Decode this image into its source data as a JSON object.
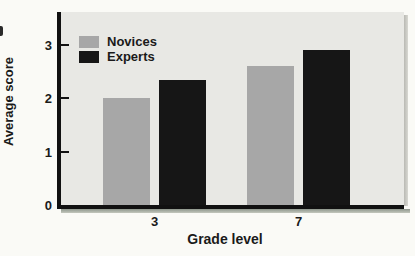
{
  "figure": {
    "page_background": "#fafaf6",
    "plot_background": "#e8e8e4",
    "axis_color": "#111111",
    "text_color": "#1a1a1a"
  },
  "legend": {
    "items": [
      {
        "label": "Novices",
        "swatch": "novices-swatch"
      },
      {
        "label": "Experts",
        "swatch": "experts-swatch"
      }
    ]
  },
  "chart_data": {
    "type": "bar",
    "title": "",
    "xlabel": "Grade level",
    "ylabel": "Average score",
    "categories": [
      "3",
      "7"
    ],
    "series": [
      {
        "name": "Novices",
        "color": "#a7a7a7",
        "values": [
          2.0,
          2.6
        ]
      },
      {
        "name": "Experts",
        "color": "#161616",
        "values": [
          2.35,
          2.9
        ]
      }
    ],
    "yticks": [
      0,
      1,
      2,
      3
    ],
    "ylim": [
      0,
      3.6
    ],
    "grid": false,
    "legend_position": "top-left"
  }
}
